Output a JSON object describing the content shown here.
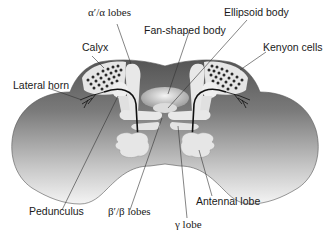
{
  "diagram": {
    "labels": {
      "alpha_lobes": "α′/α lobes",
      "fan_shaped_body": "Fan-shaped body",
      "ellipsoid_body": "Ellipsoid body",
      "calyx": "Calyx",
      "kenyon_cells": "Kenyon cells",
      "lateral_horn": "Lateral horn",
      "pedunculus": "Pedunculus",
      "beta_lobes": "β′/β lobes",
      "gamma_lobe": "γ lobe",
      "antennal_lobe": "Antennal lobe"
    },
    "colors": {
      "brain_dark": "#5a5a5a",
      "brain_light": "#f2f2f2",
      "structure_light": "#e8e8e8",
      "line": "#333333"
    }
  }
}
